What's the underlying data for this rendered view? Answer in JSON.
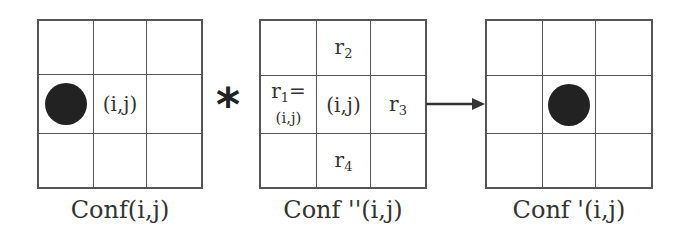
{
  "diagram": {
    "grid_left": {
      "caption": "Conf(i,j)",
      "cells": [
        "",
        "",
        "",
        "dot",
        "(i,j)",
        "",
        "",
        "",
        ""
      ]
    },
    "operator": "*",
    "grid_middle": {
      "caption": "Conf ''(i,j)",
      "labels": {
        "r2": "r",
        "r2_sub": "2",
        "r1": "r",
        "r1_sub": "1",
        "r1_eq": "=",
        "r1_val": "(i,j)",
        "center": "(i,j)",
        "r3": "r",
        "r3_sub": "3",
        "r4": "r",
        "r4_sub": "4"
      }
    },
    "arrow": "right",
    "grid_right": {
      "caption": "Conf '(i,j)",
      "cells": [
        "",
        "",
        "",
        "",
        "dot",
        "",
        "",
        "",
        ""
      ]
    },
    "colors": {
      "line": "#555555",
      "dot": "#222222",
      "text": "#333333"
    }
  }
}
